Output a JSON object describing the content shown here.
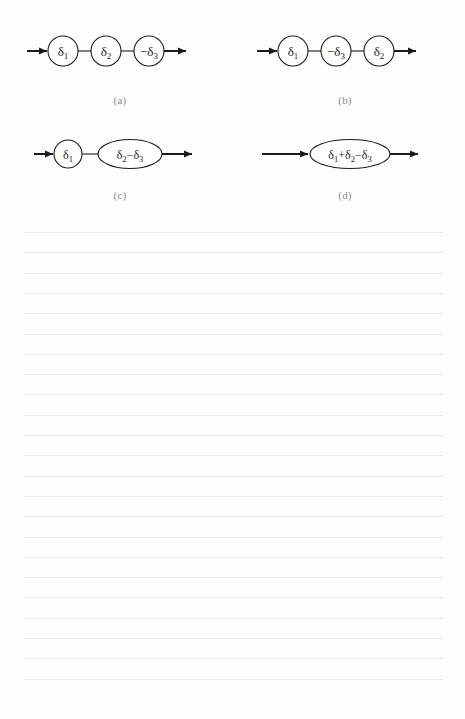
{
  "page": {
    "background_color": "#fdfdfd",
    "width": 465,
    "height": 719
  },
  "figure": {
    "stroke_color": "#1b1b1b",
    "caption_color": "#8c8c8c",
    "diagrams": [
      {
        "id": "a",
        "caption": "(a)",
        "shape_type": "circles",
        "nodes": [
          {
            "label": "δ1",
            "display": "δ₁",
            "base": "δ",
            "sub": "1",
            "sign": ""
          },
          {
            "label": "δ2",
            "display": "δ₂",
            "base": "δ",
            "sub": "2",
            "sign": ""
          },
          {
            "label": "-δ3",
            "display": "−δ₃",
            "base": "δ",
            "sub": "3",
            "sign": "−"
          }
        ]
      },
      {
        "id": "b",
        "caption": "(b)",
        "shape_type": "circles",
        "nodes": [
          {
            "label": "δ1",
            "display": "δ₁",
            "base": "δ",
            "sub": "1",
            "sign": ""
          },
          {
            "label": "-δ3",
            "display": "−δ₃",
            "base": "δ",
            "sub": "3",
            "sign": "−"
          },
          {
            "label": "δ2",
            "display": "δ₂",
            "base": "δ",
            "sub": "2",
            "sign": ""
          }
        ]
      },
      {
        "id": "c",
        "caption": "(c)",
        "shape_type": "circle-then-ellipse",
        "nodes": [
          {
            "label": "δ1",
            "display": "δ₁",
            "base": "δ",
            "sub": "1",
            "sign": ""
          },
          {
            "label": "δ2-δ3",
            "display": "δ₂−δ₃",
            "base": "δ",
            "sub": "2",
            "sign": ""
          }
        ]
      },
      {
        "id": "d",
        "caption": "(d)",
        "shape_type": "ellipse",
        "nodes": [
          {
            "label": "δ1+δ2-δ3",
            "display": "δ₁+δ₂−δ₃",
            "base": "δ",
            "sub": "1",
            "sign": ""
          }
        ]
      }
    ],
    "labels": {
      "a_n1": "δ",
      "a_n1_sub": "1",
      "a_n2": "δ",
      "a_n2_sub": "2",
      "a_n3_sign": "−",
      "a_n3": "δ",
      "a_n3_sub": "3",
      "b_n1": "δ",
      "b_n1_sub": "1",
      "b_n2_sign": "−",
      "b_n2": "δ",
      "b_n2_sub": "3",
      "b_n3": "δ",
      "b_n3_sub": "2",
      "c_n1": "δ",
      "c_n1_sub": "1",
      "c_n2_a": "δ",
      "c_n2_a_sub": "2",
      "c_n2_op": "−",
      "c_n2_b": "δ",
      "c_n2_b_sub": "3",
      "d_a": "δ",
      "d_a_sub": "1",
      "d_op1": "+",
      "d_b": "δ",
      "d_b_sub": "2",
      "d_op2": "−",
      "d_c": "δ",
      "d_c_sub": "3"
    },
    "captions": {
      "a": "(a)",
      "b": "(b)",
      "c": "(c)",
      "d": "(d)"
    }
  },
  "ruled_paper": {
    "line_color": "#e9e9ec",
    "line_count": 23,
    "first_line_y": 12,
    "line_spacing": 20.3,
    "left_x": 24,
    "right_x": 443
  }
}
